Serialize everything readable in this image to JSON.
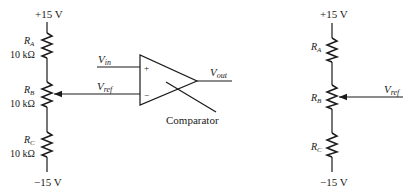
{
  "left_circuit": {
    "supply_top": "+15 V",
    "supply_bottom": "−15 V",
    "resistors": [
      {
        "name": "R",
        "sub": "A",
        "value": "10 kΩ"
      },
      {
        "name": "R",
        "sub": "B",
        "value": "10 kΩ"
      },
      {
        "name": "R",
        "sub": "C",
        "value": "10 kΩ"
      }
    ],
    "inputs": {
      "vin": {
        "name": "V",
        "sub": "in"
      },
      "vref": {
        "name": "V",
        "sub": "ref"
      }
    },
    "comparator": {
      "plus": "+",
      "minus": "−",
      "label": "Comparator",
      "output": {
        "name": "V",
        "sub": "out"
      }
    }
  },
  "right_circuit": {
    "supply_top": "+15 V",
    "supply_bottom": "−15 V",
    "resistors": [
      {
        "name": "R",
        "sub": "A"
      },
      {
        "name": "R",
        "sub": "B"
      },
      {
        "name": "R",
        "sub": "C"
      }
    ],
    "output": {
      "name": "V",
      "sub": "ref"
    }
  }
}
